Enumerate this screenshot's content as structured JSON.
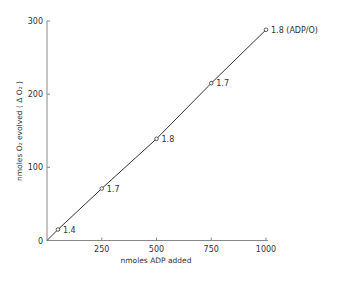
{
  "chart_data": {
    "type": "line",
    "title": "",
    "xlabel": "nmoles  ADP  added",
    "ylabel": "nmoles  O₂  evolved  ( Δ O₂ )",
    "xlim": [
      0,
      1000
    ],
    "ylim": [
      0,
      300
    ],
    "xticks": [
      250,
      500,
      750,
      1000
    ],
    "xtick_labels": [
      "250",
      "500",
      "750",
      "1000"
    ],
    "yticks": [
      0,
      100,
      200,
      300
    ],
    "ytick_labels": [
      "0",
      "100",
      "200",
      "300"
    ],
    "grid": false,
    "legend": null,
    "series": [
      {
        "name": "O2 evolved",
        "x": [
          0,
          50,
          250,
          500,
          750,
          1000
        ],
        "y": [
          0,
          15,
          71,
          139,
          215,
          288
        ],
        "point_labels": [
          "",
          "1.4",
          "1.7",
          "1.8",
          "1.7",
          "1.8  (ADP/O)"
        ],
        "marker": "open-circle",
        "color": "#333333"
      }
    ]
  }
}
